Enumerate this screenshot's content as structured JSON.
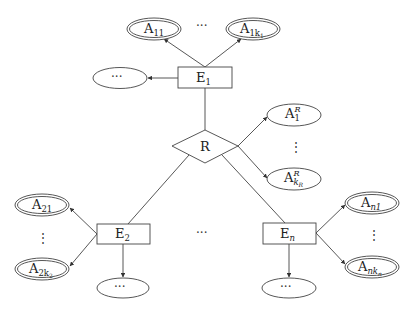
{
  "diagram": {
    "type": "er-diagram",
    "relationship": {
      "label": "R"
    },
    "entities": {
      "e1": {
        "base": "E",
        "sub": "1"
      },
      "e2": {
        "base": "E",
        "sub": "2"
      },
      "en": {
        "base": "E",
        "sub": "n"
      }
    },
    "attributes": {
      "a11": {
        "base": "A",
        "sub": "11"
      },
      "a1k1": {
        "base": "A",
        "sub": "1k",
        "subsub": "1"
      },
      "a21": {
        "base": "A",
        "sub": "21"
      },
      "a2k2": {
        "base": "A",
        "sub": "2k",
        "subsub": "2"
      },
      "an1": {
        "base": "A",
        "sub": "n1"
      },
      "ankn": {
        "base": "A",
        "sub": "nk",
        "subsub": "n"
      },
      "ar1": {
        "base": "A",
        "sup": "R",
        "sub": "1"
      },
      "arkr": {
        "base": "A",
        "sup": "R",
        "sub": "k",
        "subsub": "R"
      }
    },
    "ellipsis": {
      "horizontal": "···",
      "vertical": "⋮",
      "e1_more": "···",
      "e2_more": "···",
      "en_more": "···",
      "top_between": "···",
      "entities_between": "···"
    }
  }
}
